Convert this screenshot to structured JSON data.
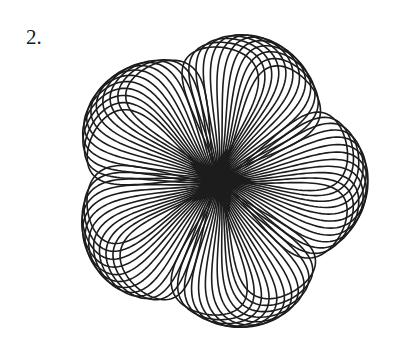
{
  "problem": {
    "number_label": "2."
  },
  "figure": {
    "stroke_color": "#1c1c1c",
    "background": "#ffffff",
    "center": [
      218,
      181
    ],
    "petal_count": 5,
    "loops_per_petal": 12,
    "petal_base_angles_deg": [
      -92,
      -20,
      52,
      124,
      196
    ],
    "loop_angle_step_deg": 3.6,
    "petal_length": 150,
    "petal_width": 38,
    "tip_skew": 0.22
  }
}
